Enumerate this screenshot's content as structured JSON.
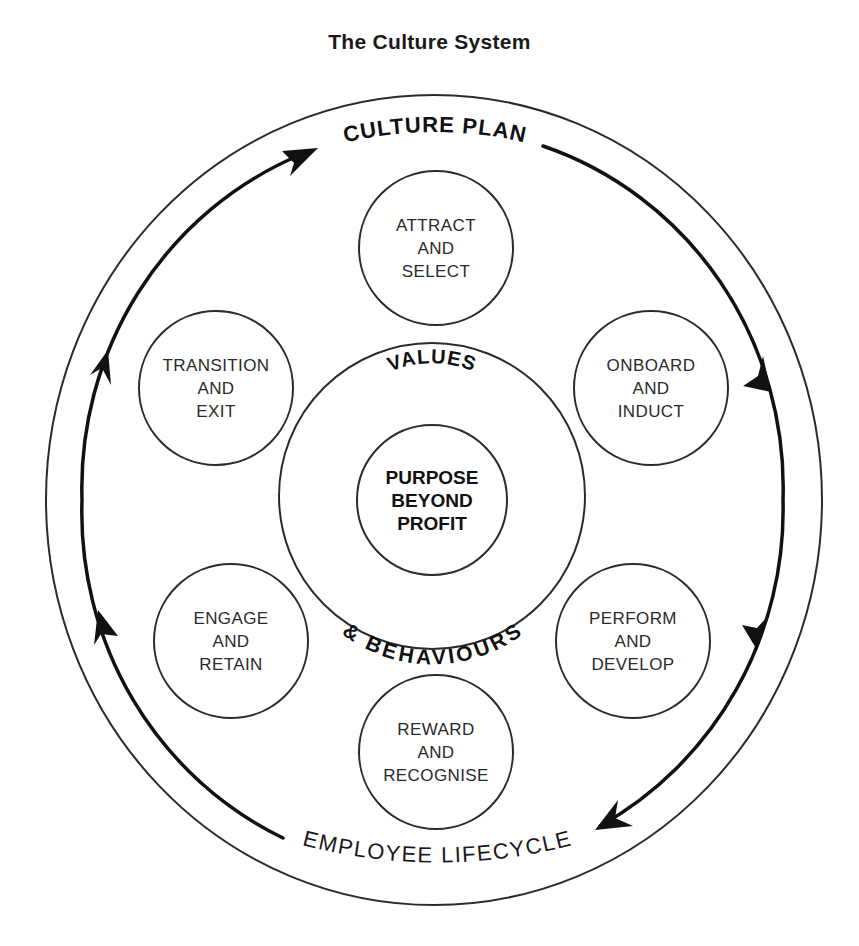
{
  "title": "The Culture System",
  "outer_ring": {
    "top_label": "CULTURE PLAN",
    "bottom_label": "EMPLOYEE LIFECYCLE"
  },
  "values_ring": {
    "top_label": "VALUES",
    "bottom_label": "& BEHAVIOURS"
  },
  "core": {
    "line1": "PURPOSE",
    "line2": "BEYOND",
    "line3": "PROFIT"
  },
  "stages": [
    {
      "line1": "ATTRACT",
      "line2": "AND",
      "line3": "SELECT"
    },
    {
      "line1": "ONBOARD",
      "line2": "AND",
      "line3": "INDUCT"
    },
    {
      "line1": "PERFORM",
      "line2": "AND",
      "line3": "DEVELOP"
    },
    {
      "line1": "REWARD",
      "line2": "AND",
      "line3": "RECOGNISE"
    },
    {
      "line1": "ENGAGE",
      "line2": "AND",
      "line3": "RETAIN"
    },
    {
      "line1": "TRANSITION",
      "line2": "AND",
      "line3": "EXIT"
    }
  ],
  "colors": {
    "line": "#2b2b2b",
    "arrow": "#111111",
    "background": "#ffffff"
  }
}
